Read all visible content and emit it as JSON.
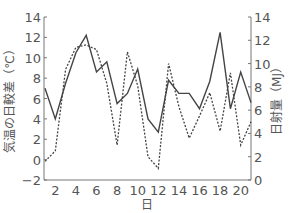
{
  "chart_data": {
    "type": "line",
    "title": "",
    "xlabel": "日",
    "ylabel_left": "気温の日較差（℃）",
    "ylabel_right": "日射量（MJ）",
    "x": [
      1,
      2,
      3,
      4,
      5,
      6,
      7,
      8,
      9,
      10,
      11,
      12,
      13,
      14,
      15,
      16,
      17,
      18,
      19,
      20,
      21
    ],
    "xticks": [
      2,
      4,
      6,
      8,
      10,
      12,
      14,
      16,
      18,
      20
    ],
    "ylim_left": [
      -2,
      14
    ],
    "yticks_left": [
      -2,
      0,
      2,
      4,
      6,
      8,
      10,
      12,
      14
    ],
    "ylim_right": [
      0,
      14
    ],
    "yticks_right": [
      0,
      2,
      4,
      6,
      8,
      10,
      12,
      14
    ],
    "grid": false,
    "legend": "none",
    "series": [
      {
        "name": "気温の日較差",
        "axis": "left",
        "style": "solid",
        "color": "#444444",
        "values": [
          7.0,
          4.0,
          7.5,
          10.5,
          12.2,
          8.6,
          9.6,
          5.5,
          6.5,
          8.9,
          4.0,
          2.7,
          7.8,
          6.5,
          6.5,
          5.0,
          7.7,
          12.5,
          5.0,
          8.6,
          5.6
        ]
      },
      {
        "name": "日射量",
        "axis": "right",
        "style": "dashed",
        "color": "#444444",
        "values": [
          1.6,
          2.5,
          9.5,
          11.4,
          11.6,
          11.2,
          8.3,
          3.0,
          11.0,
          8.1,
          2.0,
          1.0,
          10.0,
          6.3,
          3.6,
          5.5,
          7.5,
          4.2,
          9.2,
          3.0,
          5.0
        ]
      }
    ]
  }
}
